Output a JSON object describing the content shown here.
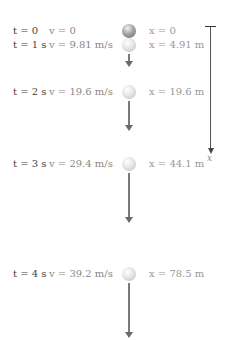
{
  "diagram": {
    "axis": {
      "label": "x",
      "direction": "down"
    },
    "rows": [
      {
        "t": "t = 0",
        "v": "v = 0",
        "x": "x = 0",
        "top": 24,
        "arrow_len": 0
      },
      {
        "t": "t = 1 s",
        "v": "v = 9.81 m/s",
        "x": "x = 4.91 m",
        "top": 38,
        "arrow_len": 10
      },
      {
        "t": "t = 2 s",
        "v": "v = 19.6 m/s",
        "x": "x = 19.6 m",
        "top": 85,
        "arrow_len": 28
      },
      {
        "t": "t = 3 s",
        "v": "v = 29.4 m/s",
        "x": "x = 44.1 m",
        "top": 157,
        "arrow_len": 48
      },
      {
        "t": "t = 4 s",
        "v": "v = 39.2 m/s",
        "x": "x = 78.5 m",
        "top": 267,
        "arrow_len": 52
      }
    ],
    "colors": {
      "time_text": "#444444",
      "velocity_text": "#888888",
      "position_text": "#999999",
      "arrow": "#7a7a7a",
      "axis": "#555555"
    }
  }
}
